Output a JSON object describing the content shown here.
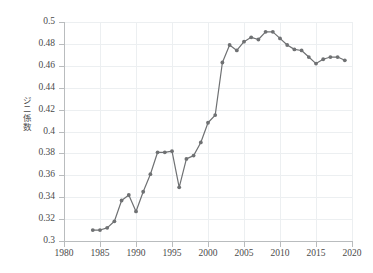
{
  "chart_data": {
    "type": "line",
    "title": "",
    "subtitle": "",
    "xlabel": "",
    "ylabel": "ジニ係数",
    "ylabel_chars": [
      "ジ",
      "ニ",
      "係",
      "数"
    ],
    "xlim": [
      1980,
      2020
    ],
    "ylim": [
      0.3,
      0.5
    ],
    "grid": true,
    "legend": null,
    "marker": "circle",
    "line_color": "#6f7173",
    "marker_color": "#6f7173",
    "grid_color": "#eceff1",
    "axis_color": "#b9bcbe",
    "background_color": "#ffffff",
    "x_ticks": [
      1980,
      1985,
      1990,
      1995,
      2000,
      2005,
      2010,
      2015,
      2020
    ],
    "y_ticks": [
      0.3,
      0.32,
      0.34,
      0.36,
      0.38,
      0.4,
      0.42,
      0.44,
      0.46,
      0.48,
      0.5
    ],
    "x_tick_labels": [
      "1980",
      "1985",
      "1990",
      "1995",
      "2000",
      "2005",
      "2010",
      "2015",
      "2020"
    ],
    "y_tick_labels": [
      "0.3",
      "0.32",
      "0.34",
      "0.36",
      "0.38",
      "0.4",
      "0.42",
      "0.44",
      "0.46",
      "0.48",
      "0.5"
    ],
    "series": [
      {
        "name": "ジニ係数",
        "x": [
          1984,
          1985,
          1986,
          1987,
          1988,
          1989,
          1990,
          1991,
          1992,
          1993,
          1994,
          1995,
          1996,
          1997,
          1998,
          1999,
          2000,
          2001,
          2002,
          2003,
          2004,
          2005,
          2006,
          2007,
          2008,
          2009,
          2010,
          2011,
          2012,
          2013,
          2014,
          2015,
          2016,
          2017,
          2018,
          2019
        ],
        "values": [
          0.31,
          0.31,
          0.312,
          0.318,
          0.337,
          0.342,
          0.327,
          0.345,
          0.361,
          0.381,
          0.381,
          0.382,
          0.349,
          0.375,
          0.378,
          0.39,
          0.408,
          0.415,
          0.463,
          0.479,
          0.474,
          0.482,
          0.486,
          0.484,
          0.491,
          0.491,
          0.485,
          0.479,
          0.475,
          0.474,
          0.468,
          0.462,
          0.466,
          0.468,
          0.468,
          0.465
        ]
      }
    ]
  }
}
